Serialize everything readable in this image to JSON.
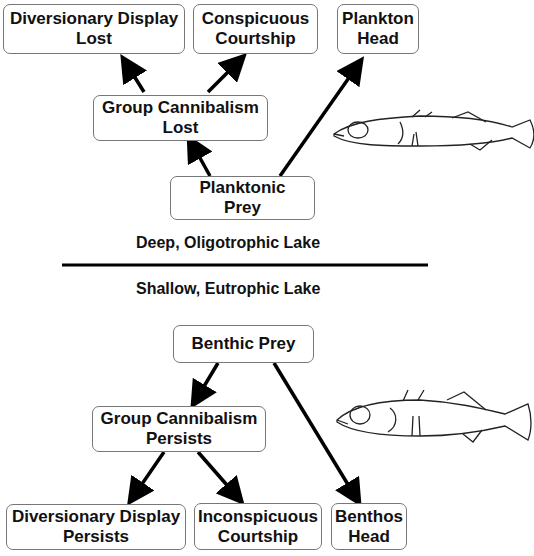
{
  "top_section": {
    "label": "Deep, Oligotrophic Lake",
    "nodes": {
      "div_display_lost": {
        "line1": "Diversionary Display",
        "line2": "Lost"
      },
      "conspicuous": {
        "line1": "Conspicuous",
        "line2": "Courtship"
      },
      "plankton_head": {
        "line1": "Plankton",
        "line2": "Head"
      },
      "cannibalism_lost": {
        "line1": "Group Cannibalism",
        "line2": "Lost"
      },
      "planktonic_prey": {
        "line1": "Planktonic",
        "line2": "Prey"
      }
    },
    "fish": "limnetic-stickleback-drawing"
  },
  "bottom_section": {
    "label": "Shallow, Eutrophic Lake",
    "nodes": {
      "benthic_prey": {
        "line1": "Benthic Prey"
      },
      "cannibalism_persists": {
        "line1": "Group Cannibalism",
        "line2": "Persists"
      },
      "div_display_persists": {
        "line1": "Diversionary Display",
        "line2": "Persists"
      },
      "inconspicuous": {
        "line1": "Inconspicuous",
        "line2": "Courtship"
      },
      "benthos_head": {
        "line1": "Benthos",
        "line2": "Head"
      }
    },
    "fish": "benthic-stickleback-drawing"
  },
  "edges": [
    {
      "from": "planktonic_prey",
      "to": "cannibalism_lost"
    },
    {
      "from": "planktonic_prey",
      "to": "plankton_head"
    },
    {
      "from": "cannibalism_lost",
      "to": "div_display_lost"
    },
    {
      "from": "cannibalism_lost",
      "to": "conspicuous"
    },
    {
      "from": "benthic_prey",
      "to": "cannibalism_persists"
    },
    {
      "from": "benthic_prey",
      "to": "benthos_head"
    },
    {
      "from": "cannibalism_persists",
      "to": "div_display_persists"
    },
    {
      "from": "cannibalism_persists",
      "to": "inconspicuous"
    }
  ]
}
